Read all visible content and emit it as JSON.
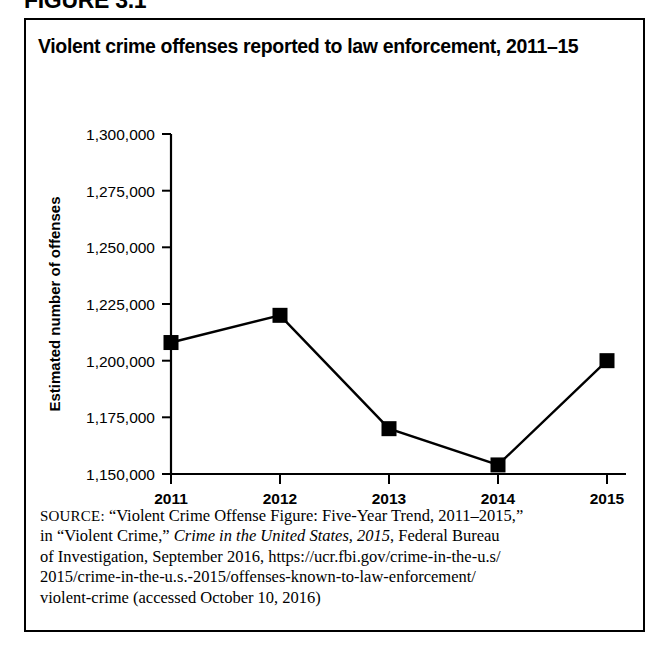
{
  "figure": {
    "label": "FIGURE 3.1"
  },
  "chart": {
    "title": "Violent crime offenses reported to law enforcement, 2011–15"
  },
  "chart_data": {
    "type": "line",
    "title": "Violent crime offenses reported to law enforcement, 2011–15",
    "xlabel": "",
    "ylabel": "Estimated number of offenses",
    "categories": [
      "2011",
      "2012",
      "2013",
      "2014",
      "2015"
    ],
    "values": [
      1208000,
      1220000,
      1170000,
      1154000,
      1200000
    ],
    "ylim": [
      1150000,
      1300000
    ],
    "ytick_values": [
      1150000,
      1175000,
      1200000,
      1225000,
      1250000,
      1275000,
      1300000
    ],
    "ytick_labels": [
      "1,150,000",
      "1,175,000",
      "1,200,000",
      "1,225,000",
      "1,250,000",
      "1,275,000",
      "1,300,000"
    ],
    "xtick_labels": [
      "2011",
      "2012",
      "2013",
      "2014",
      "2015"
    ],
    "grid": false,
    "legend": null,
    "marker": "square",
    "marker_color": "#000000",
    "line_color": "#000000"
  },
  "source": {
    "prefix": "SOURCE:",
    "line1_rest": " “Violent Crime Offense Figure: Five-Year Trend, 2011–2015,”",
    "line2_pre": "in “Violent Crime,” ",
    "line2_italic": "Crime in the United States, 2015",
    "line2_post": ", Federal Bureau",
    "line3": "of Investigation, September 2016, https://ucr.fbi.gov/crime-in-the-u.s/",
    "line4": "2015/crime-in-the-u.s.-2015/offenses-known-to-law-enforcement/",
    "line5": "violent-crime (accessed October 10, 2016)"
  }
}
